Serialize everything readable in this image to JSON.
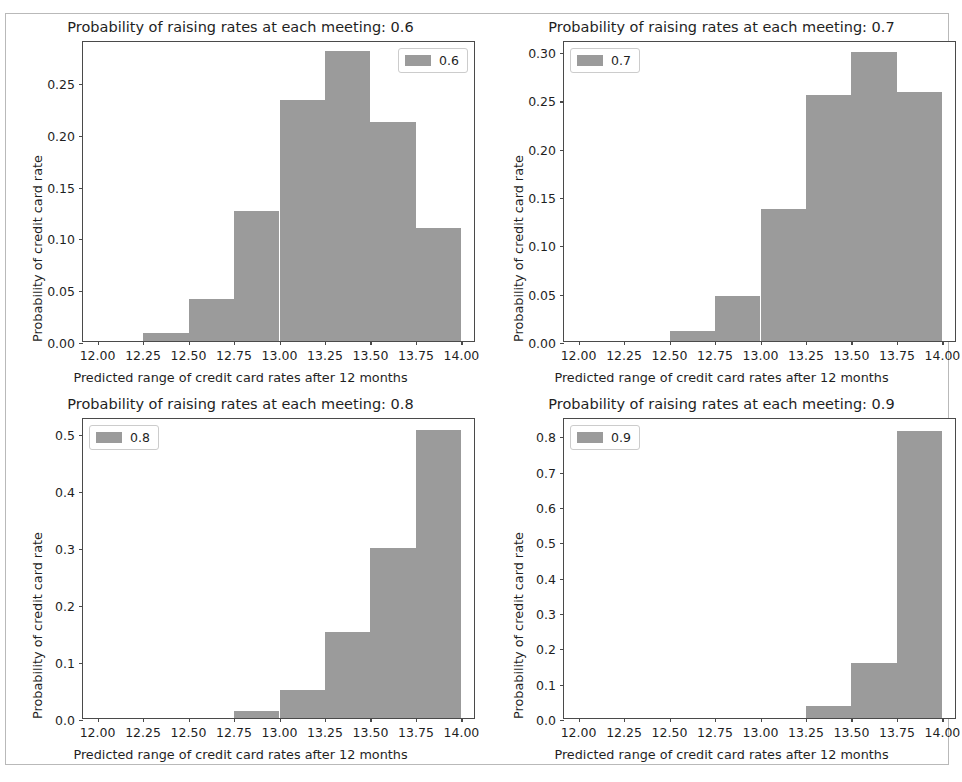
{
  "figure": {
    "width": 962,
    "height": 782,
    "background": "#ffffff",
    "frame_color": "#b9b9b9",
    "bar_color": "#9b9b9b",
    "axis_color": "#4a4a4a",
    "text_color": "#1f1f1f"
  },
  "chart_data": [
    {
      "type": "bar",
      "title": "Probability of raising rates at each meeting: 0.6",
      "xlabel": "Predicted range of credit card rates after 12 months",
      "ylabel": "Probability of credit card rate",
      "legend": [
        "0.6"
      ],
      "legend_position": "upper right",
      "grid": false,
      "xlim": [
        11.92,
        14.08
      ],
      "ylim": [
        0,
        0.2905
      ],
      "xticks": [
        12.0,
        12.25,
        12.5,
        12.75,
        13.0,
        13.25,
        13.5,
        13.75,
        14.0
      ],
      "xtick_labels": [
        "12.00",
        "12.25",
        "12.50",
        "12.75",
        "13.00",
        "13.25",
        "13.50",
        "13.75",
        "14.00"
      ],
      "yticks": [
        0.0,
        0.05,
        0.1,
        0.15,
        0.2,
        0.25
      ],
      "ytick_labels": [
        "0.00",
        "0.05",
        "0.10",
        "0.15",
        "0.20",
        "0.25"
      ],
      "bin_edges": [
        12.25,
        12.5,
        12.75,
        13.0,
        13.25,
        13.5,
        13.75,
        14.0
      ],
      "values": [
        0.008,
        0.041,
        0.125,
        0.233,
        0.28,
        0.211,
        0.109
      ]
    },
    {
      "type": "bar",
      "title": "Probability of raising rates at each meeting: 0.7",
      "xlabel": "Predicted range of credit card rates after 12 months",
      "ylabel": "Probability of credit card rate",
      "legend": [
        "0.7"
      ],
      "legend_position": "upper left",
      "grid": false,
      "xlim": [
        11.92,
        14.08
      ],
      "ylim": [
        0,
        0.3115
      ],
      "xticks": [
        12.0,
        12.25,
        12.5,
        12.75,
        13.0,
        13.25,
        13.5,
        13.75,
        14.0
      ],
      "xtick_labels": [
        "12.00",
        "12.25",
        "12.50",
        "12.75",
        "13.00",
        "13.25",
        "13.50",
        "13.75",
        "14.00"
      ],
      "yticks": [
        0.0,
        0.05,
        0.1,
        0.15,
        0.2,
        0.25,
        0.3
      ],
      "ytick_labels": [
        "0.00",
        "0.05",
        "0.10",
        "0.15",
        "0.20",
        "0.25",
        "0.30"
      ],
      "bin_edges": [
        12.5,
        12.75,
        13.0,
        13.25,
        13.5,
        13.75,
        14.0
      ],
      "values": [
        0.01,
        0.047,
        0.137,
        0.255,
        0.299,
        0.258
      ]
    },
    {
      "type": "bar",
      "title": "Probability of raising rates at each meeting: 0.8",
      "xlabel": "Predicted range of credit card rates after 12 months",
      "ylabel": "Probability of credit card rate",
      "legend": [
        "0.8"
      ],
      "legend_position": "upper left",
      "grid": false,
      "xlim": [
        11.92,
        14.08
      ],
      "ylim": [
        0,
        0.528
      ],
      "xticks": [
        12.0,
        12.25,
        12.5,
        12.75,
        13.0,
        13.25,
        13.5,
        13.75,
        14.0
      ],
      "xtick_labels": [
        "12.00",
        "12.25",
        "12.50",
        "12.75",
        "13.00",
        "13.25",
        "13.50",
        "13.75",
        "14.00"
      ],
      "yticks": [
        0.0,
        0.1,
        0.2,
        0.3,
        0.4,
        0.5
      ],
      "ytick_labels": [
        "0.0",
        "0.1",
        "0.2",
        "0.3",
        "0.4",
        "0.5"
      ],
      "bin_edges": [
        12.75,
        13.0,
        13.25,
        13.5,
        13.75,
        14.0
      ],
      "values": [
        0.012,
        0.049,
        0.151,
        0.298,
        0.505
      ]
    },
    {
      "type": "bar",
      "title": "Probability of raising rates at each meeting: 0.9",
      "xlabel": "Predicted range of credit card rates after 12 months",
      "ylabel": "Probability of credit card rate",
      "legend": [
        "0.9"
      ],
      "legend_position": "upper left",
      "grid": false,
      "xlim": [
        11.92,
        14.08
      ],
      "ylim": [
        0,
        0.852
      ],
      "xticks": [
        12.0,
        12.25,
        12.5,
        12.75,
        13.0,
        13.25,
        13.5,
        13.75,
        14.0
      ],
      "xtick_labels": [
        "12.00",
        "12.25",
        "12.50",
        "12.75",
        "13.00",
        "13.25",
        "13.50",
        "13.75",
        "14.00"
      ],
      "yticks": [
        0.0,
        0.1,
        0.2,
        0.3,
        0.4,
        0.5,
        0.6,
        0.7,
        0.8
      ],
      "ytick_labels": [
        "0.0",
        "0.1",
        "0.2",
        "0.3",
        "0.4",
        "0.5",
        "0.6",
        "0.7",
        "0.8"
      ],
      "bin_edges": [
        13.25,
        13.5,
        13.75,
        14.0
      ],
      "values": [
        0.035,
        0.155,
        0.813
      ]
    }
  ],
  "layout": {
    "subplots": [
      {
        "left": 0,
        "top": 14,
        "width": 481,
        "height": 377,
        "axes": {
          "left": 82,
          "top": 27,
          "width": 393,
          "height": 301
        }
      },
      {
        "left": 481,
        "top": 14,
        "width": 481,
        "height": 377,
        "axes": {
          "left": 82,
          "top": 27,
          "width": 393,
          "height": 301
        }
      },
      {
        "left": 0,
        "top": 391,
        "width": 481,
        "height": 377,
        "axes": {
          "left": 82,
          "top": 27,
          "width": 393,
          "height": 301
        }
      },
      {
        "left": 481,
        "top": 391,
        "width": 481,
        "height": 377,
        "axes": {
          "left": 82,
          "top": 27,
          "width": 393,
          "height": 301
        }
      }
    ]
  }
}
